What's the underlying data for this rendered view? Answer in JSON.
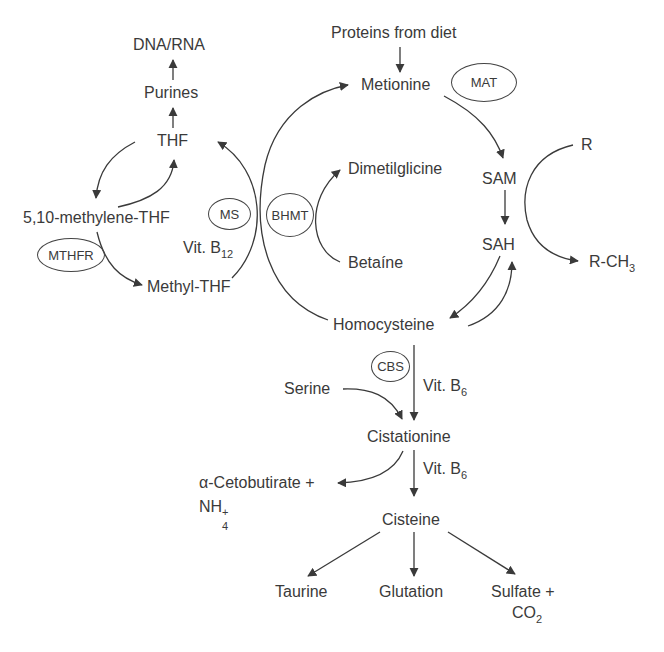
{
  "diagram": {
    "type": "metabolic-pathway",
    "nodes": {
      "dna_rna": "DNA/RNA",
      "purines": "Purines",
      "thf": "THF",
      "methylene_thf": "5,10-methylene-THF",
      "methyl_thf": "Methyl-THF",
      "vit_b12": "Vit. B",
      "vit_b12_sub": "12",
      "proteins_from_diet": "Proteins from diet",
      "metionine": "Metionine",
      "sam": "SAM",
      "sah": "SAH",
      "r": "R",
      "r_ch3": "R-CH",
      "r_ch3_sub": "3",
      "dimetilglicine": "Dimetilglicine",
      "betaine": "Betaíne",
      "homocysteine": "Homocysteine",
      "serine": "Serine",
      "vit_b6_1": "Vit. B",
      "vit_b6_1_sub": "6",
      "cistationine": "Cistationine",
      "vit_b6_2": "Vit. B",
      "vit_b6_2_sub": "6",
      "cetobutirate": "α-Cetobutirate +",
      "nh4": "NH",
      "nh4_sub": "4",
      "nh4_sup": "+",
      "cisteine": "Cisteine",
      "taurine": "Taurine",
      "glutation": "Glutation",
      "sulfate": "Sulfate +",
      "co2": "CO",
      "co2_sub": "2"
    },
    "enzymes": {
      "mthfr": "MTHFR",
      "ms": "MS",
      "bhmt": "BHMT",
      "mat": "MAT",
      "cbs": "CBS"
    },
    "edges": [
      {
        "from": "Purines",
        "to": "DNA/RNA"
      },
      {
        "from": "THF",
        "to": "Purines"
      },
      {
        "from": "THF",
        "to": "5,10-methylene-THF"
      },
      {
        "from": "5,10-methylene-THF",
        "to": "THF"
      },
      {
        "from": "5,10-methylene-THF",
        "to": "Methyl-THF",
        "enzyme": "MTHFR"
      },
      {
        "from": "Methyl-THF",
        "to": "THF",
        "enzyme": "MS",
        "cofactor": "Vit. B12"
      },
      {
        "from": "Homocysteine",
        "to": "Metionine",
        "enzyme": "MS / BHMT"
      },
      {
        "from": "Betaíne",
        "to": "Dimetilglicine",
        "enzyme": "BHMT"
      },
      {
        "from": "Proteins from diet",
        "to": "Metionine"
      },
      {
        "from": "Metionine",
        "to": "SAM",
        "enzyme": "MAT"
      },
      {
        "from": "SAM",
        "to": "SAH"
      },
      {
        "from": "R",
        "to": "R-CH3"
      },
      {
        "from": "SAH",
        "to": "Homocysteine"
      },
      {
        "from": "Homocysteine",
        "to": "SAH"
      },
      {
        "from": "Homocysteine",
        "to": "Cistationine",
        "enzyme": "CBS",
        "cofactor": "Vit. B6"
      },
      {
        "from": "Serine",
        "to": "Cistationine"
      },
      {
        "from": "Cistationine",
        "to": "α-Cetobutirate + NH4+"
      },
      {
        "from": "Cistationine",
        "to": "Cisteine",
        "cofactor": "Vit. B6"
      },
      {
        "from": "Cisteine",
        "to": "Taurine"
      },
      {
        "from": "Cisteine",
        "to": "Glutation"
      },
      {
        "from": "Cisteine",
        "to": "Sulfate + CO2"
      }
    ],
    "colors": {
      "line": "#3a3a3a",
      "text": "#3a3a3a",
      "background": "#ffffff"
    }
  }
}
